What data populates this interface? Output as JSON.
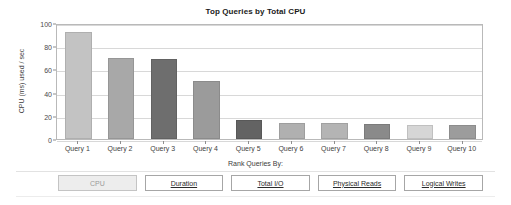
{
  "chart_data": {
    "type": "bar",
    "title": "Top Queries by Total CPU",
    "xlabel": "",
    "ylabel": "CPU (ms) used / sec",
    "categories": [
      "Query 1",
      "Query 2",
      "Query 3",
      "Query 4",
      "Query 5",
      "Query 6",
      "Query 7",
      "Query 8",
      "Query 9",
      "Query 10"
    ],
    "values": [
      92,
      70,
      69,
      50,
      16,
      14,
      14,
      13,
      12,
      12.5
    ],
    "bar_colors": [
      "#c3c3c3",
      "#a8a8a8",
      "#6e6e6e",
      "#9b9b9b",
      "#636363",
      "#b0b0b0",
      "#b4b4b4",
      "#8a8a8a",
      "#d6d6d6",
      "#9c9c9c"
    ],
    "ylim": [
      0,
      100
    ],
    "yticks": [
      0,
      20,
      40,
      60,
      80,
      100
    ],
    "ytick_labels": [
      "0",
      "20",
      "40",
      "60",
      "80",
      "100"
    ],
    "grid": true,
    "legend": "none"
  },
  "footer": {
    "caption": "Rank Queries By:",
    "buttons": [
      {
        "label": "CPU",
        "active": true
      },
      {
        "label": "Duration",
        "active": false
      },
      {
        "label": "Total I/O",
        "active": false
      },
      {
        "label": "Physical Reads",
        "active": false
      },
      {
        "label": "Logical Writes",
        "active": false
      }
    ]
  }
}
